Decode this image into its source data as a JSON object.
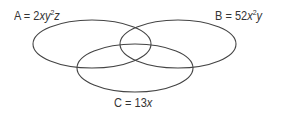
{
  "diagram": {
    "type": "venn",
    "sets": [
      {
        "id": "A",
        "name": "A",
        "expression": "2xy²z",
        "parts": {
          "coef": "2",
          "v1": "xy",
          "exp": "2",
          "v2": "z"
        },
        "ellipse": {
          "cx": 92,
          "cy": 44,
          "rx": 59,
          "ry": 24
        }
      },
      {
        "id": "B",
        "name": "B",
        "expression": "52x²y",
        "parts": {
          "coef": "52",
          "v1": "x",
          "exp": "2",
          "v2": "y"
        },
        "ellipse": {
          "cx": 178,
          "cy": 44,
          "rx": 58,
          "ry": 24
        }
      },
      {
        "id": "C",
        "name": "C",
        "expression": "13x",
        "parts": {
          "coef": "13",
          "v1": "x"
        },
        "ellipse": {
          "cx": 135,
          "cy": 68,
          "rx": 58,
          "ry": 24
        }
      }
    ],
    "equals": "=",
    "stroke_color": "#444444",
    "text_color": "#333333"
  }
}
